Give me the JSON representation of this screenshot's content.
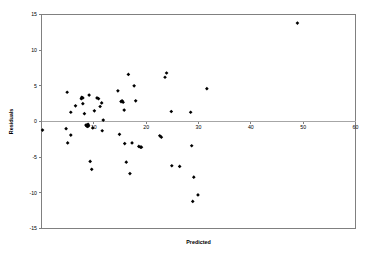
{
  "chart_data": {
    "type": "scatter",
    "title": "",
    "xlabel": "Predicted",
    "ylabel": "Residuals",
    "xlim": [
      0,
      60
    ],
    "ylim": [
      -15,
      15
    ],
    "xticks": [
      0,
      10,
      20,
      30,
      40,
      50,
      60
    ],
    "xtick_labels": [
      "",
      "10",
      "20",
      "30",
      "40",
      "50",
      "60"
    ],
    "yticks": [
      -15,
      -10,
      -5,
      0,
      5,
      10,
      15
    ],
    "ytick_labels": [
      "-15",
      "-10",
      "-5",
      "0",
      "5",
      "10",
      "15"
    ],
    "grid": false,
    "legend": false,
    "zero_reference_line": 0,
    "marker": "diamond",
    "marker_color": "#000000",
    "series": [
      {
        "name": "Residuals",
        "points": [
          [
            0.2,
            -1.2
          ],
          [
            4.7,
            -1.0
          ],
          [
            4.9,
            4.1
          ],
          [
            5.0,
            -3.0
          ],
          [
            5.6,
            1.3
          ],
          [
            5.6,
            -1.9
          ],
          [
            6.5,
            2.2
          ],
          [
            7.6,
            3.2
          ],
          [
            7.7,
            3.4
          ],
          [
            7.9,
            3.3
          ],
          [
            7.9,
            2.5
          ],
          [
            8.2,
            1.1
          ],
          [
            8.5,
            -0.5
          ],
          [
            8.6,
            -0.6
          ],
          [
            8.7,
            -0.5
          ],
          [
            8.8,
            -0.7
          ],
          [
            8.9,
            -0.4
          ],
          [
            9.0,
            -0.6
          ],
          [
            9.1,
            3.7
          ],
          [
            9.3,
            -5.6
          ],
          [
            9.6,
            -6.7
          ],
          [
            9.8,
            -0.9
          ],
          [
            10.1,
            1.5
          ],
          [
            10.6,
            3.3
          ],
          [
            10.9,
            3.2
          ],
          [
            11.2,
            2.1
          ],
          [
            11.5,
            2.6
          ],
          [
            11.6,
            -1.3
          ],
          [
            11.8,
            0.2
          ],
          [
            14.6,
            4.3
          ],
          [
            14.9,
            -1.8
          ],
          [
            15.2,
            2.8
          ],
          [
            15.4,
            2.9
          ],
          [
            15.6,
            2.7
          ],
          [
            15.8,
            1.6
          ],
          [
            15.9,
            -3.1
          ],
          [
            16.2,
            -5.7
          ],
          [
            16.6,
            6.6
          ],
          [
            16.9,
            -7.3
          ],
          [
            17.3,
            -3.0
          ],
          [
            17.7,
            5.0
          ],
          [
            18.0,
            2.9
          ],
          [
            18.6,
            -3.5
          ],
          [
            18.9,
            -3.6
          ],
          [
            19.1,
            -3.6
          ],
          [
            22.6,
            -2.0
          ],
          [
            22.9,
            -2.2
          ],
          [
            23.6,
            6.2
          ],
          [
            23.9,
            6.8
          ],
          [
            24.8,
            1.4
          ],
          [
            24.9,
            -6.2
          ],
          [
            26.4,
            -6.3
          ],
          [
            28.5,
            1.3
          ],
          [
            28.7,
            -3.4
          ],
          [
            28.9,
            -11.2
          ],
          [
            29.1,
            -7.8
          ],
          [
            29.9,
            -10.3
          ],
          [
            31.6,
            4.6
          ],
          [
            48.9,
            13.8
          ]
        ]
      }
    ]
  }
}
